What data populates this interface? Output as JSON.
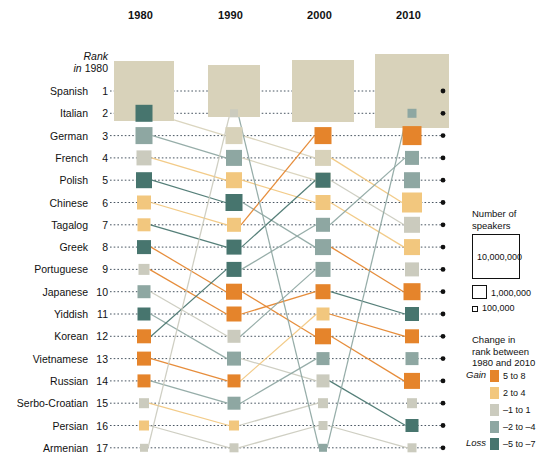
{
  "chart_data": {
    "type": "line",
    "subtype": "bump-chart-with-sized-squares",
    "title": "",
    "xlabel": "",
    "ylabel": "Rank in 1980",
    "categories": [
      "1980",
      "1990",
      "2000",
      "2010"
    ],
    "rank_axis_label_line1": "Rank",
    "rank_axis_label_line2_italic": "in",
    "rank_axis_label_line2_rest": " 1980",
    "ylim": [
      1,
      17
    ],
    "grid": false,
    "legend_position": "right",
    "rows": [
      {
        "rank": 1,
        "language": "Spanish",
        "ranks": [
          1,
          1,
          1,
          1
        ],
        "size": 10,
        "colors": [
          "beige",
          "beige",
          "beige",
          "beige"
        ],
        "sizes": [
          60,
          52,
          62,
          74
        ]
      },
      {
        "rank": 2,
        "language": "Italian",
        "ranks": [
          2,
          3,
          4,
          6
        ],
        "size": 10,
        "colors": [
          "darkteal",
          "beige",
          "beige",
          "lightorange"
        ],
        "sizes": [
          17,
          17,
          16,
          20
        ]
      },
      {
        "rank": 3,
        "language": "German",
        "ranks": [
          3,
          4,
          5,
          7
        ],
        "size": 10,
        "colors": [
          "teal",
          "teal",
          "beige",
          "graybeige"
        ],
        "sizes": [
          17,
          16,
          15,
          16
        ]
      },
      {
        "rank": 4,
        "language": "French",
        "ranks": [
          4,
          5,
          6,
          8
        ],
        "size": 10,
        "colors": [
          "graybeige",
          "lightorange",
          "lightorange",
          "lightorange"
        ],
        "sizes": [
          15,
          16,
          15,
          16
        ]
      },
      {
        "rank": 5,
        "language": "Polish",
        "ranks": [
          5,
          6,
          8,
          10
        ],
        "size": 10,
        "colors": [
          "darkteal",
          "darkteal",
          "teal",
          "orange"
        ],
        "sizes": [
          16,
          17,
          16,
          17
        ]
      },
      {
        "rank": 6,
        "language": "Chinese",
        "ranks": [
          6,
          7,
          3,
          3
        ],
        "size": 10,
        "colors": [
          "lightorange",
          "lightorange",
          "orange",
          "orange"
        ],
        "sizes": [
          14,
          14,
          17,
          19
        ]
      },
      {
        "rank": 7,
        "language": "Tagalog",
        "ranks": [
          7,
          8,
          5,
          5
        ],
        "size": 10,
        "colors": [
          "lightorange",
          "darkteal",
          "darkteal",
          "teal"
        ],
        "sizes": [
          13,
          15,
          15,
          16
        ]
      },
      {
        "rank": 8,
        "language": "Greek",
        "ranks": [
          8,
          10,
          12,
          14
        ],
        "size": 10,
        "colors": [
          "darkteal",
          "orange",
          "orange",
          "orange"
        ],
        "sizes": [
          14,
          16,
          16,
          16
        ]
      },
      {
        "rank": 9,
        "language": "Portuguese",
        "ranks": [
          9,
          11,
          10,
          11
        ],
        "size": 10,
        "colors": [
          "graybeige",
          "orange",
          "orange",
          "darkteal"
        ],
        "sizes": [
          11,
          15,
          15,
          14
        ]
      },
      {
        "rank": 10,
        "language": "Japanese",
        "ranks": [
          10,
          12,
          9,
          9
        ],
        "size": 10,
        "colors": [
          "teal",
          "graybeige",
          "teal",
          "graybeige"
        ],
        "sizes": [
          13,
          13,
          15,
          14
        ]
      },
      {
        "rank": 11,
        "language": "Yiddish",
        "ranks": [
          11,
          13,
          14,
          16
        ],
        "size": 10,
        "colors": [
          "darkteal",
          "teal",
          "graybeige",
          "darkteal"
        ],
        "sizes": [
          13,
          14,
          13,
          13
        ]
      },
      {
        "rank": 12,
        "language": "Korean",
        "ranks": [
          12,
          9,
          7,
          4
        ],
        "size": 10,
        "colors": [
          "orange",
          "darkteal",
          "teal",
          "teal"
        ],
        "sizes": [
          14,
          15,
          14,
          14
        ]
      },
      {
        "rank": 13,
        "language": "Vietnamese",
        "ranks": [
          13,
          14,
          11,
          12
        ],
        "size": 10,
        "colors": [
          "orange",
          "orange",
          "lightorange",
          "orange"
        ],
        "sizes": [
          14,
          13,
          13,
          14
        ]
      },
      {
        "rank": 14,
        "language": "Russian",
        "ranks": [
          14,
          15,
          13,
          13
        ],
        "size": 10,
        "colors": [
          "orange",
          "teal",
          "teal",
          "teal"
        ],
        "sizes": [
          13,
          13,
          13,
          13
        ]
      },
      {
        "rank": 15,
        "language": "Serbo-Croatian",
        "ranks": [
          15,
          16,
          15,
          15
        ],
        "size": 10,
        "colors": [
          "graybeige",
          "lightorange",
          "graybeige",
          "graybeige"
        ],
        "sizes": [
          10,
          10,
          10,
          10
        ]
      },
      {
        "rank": 16,
        "language": "Persian",
        "ranks": [
          16,
          17,
          16,
          17
        ],
        "size": 10,
        "colors": [
          "lightorange",
          "graybeige",
          "graybeige",
          "graybeige"
        ],
        "sizes": [
          10,
          9,
          9,
          9
        ]
      },
      {
        "rank": 17,
        "language": "Armenian",
        "ranks": [
          17,
          2,
          17,
          2
        ],
        "size": 10,
        "colors": [
          "graybeige",
          "graybeige",
          "teal",
          "teal"
        ],
        "sizes": [
          8,
          8,
          8,
          9
        ]
      }
    ],
    "size_legend": {
      "heading_line1": "Number of",
      "heading_line2": "speakers",
      "items": [
        {
          "label": "10,000,000",
          "box": 48
        },
        {
          "label": "1,000,000",
          "box": 15
        },
        {
          "label": "100,000",
          "box": 6
        }
      ]
    },
    "color_legend": {
      "heading_line1": "Change in",
      "heading_line2": "rank between",
      "heading_line3": "1980 and 2010",
      "gain_label": "Gain",
      "loss_label": "Loss",
      "items": [
        {
          "label": "5 to 8",
          "key": "orange",
          "color": "#E5842B"
        },
        {
          "label": "2 to 4",
          "key": "lightorange",
          "color": "#F2C77E"
        },
        {
          "label": "–1 to 1",
          "key": "graybeige",
          "color": "#CBCBBE"
        },
        {
          "label": "–2 to –4",
          "key": "teal",
          "color": "#8EA7A2"
        },
        {
          "label": "–5 to –7",
          "key": "darkteal",
          "color": "#47756E"
        }
      ]
    },
    "palette": {
      "orange": "#E5842B",
      "lightorange": "#F2C77E",
      "graybeige": "#CBCBBE",
      "teal": "#8EA7A2",
      "darkteal": "#47756E",
      "beige": "#D8D2BA",
      "dotline": "#2b3a48",
      "terminal_dot": "#111111"
    }
  }
}
